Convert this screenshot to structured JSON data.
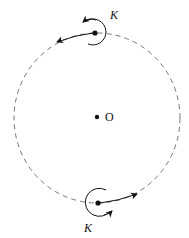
{
  "diagram": {
    "center": {
      "label": "O"
    },
    "top_body": {
      "spin_label": "K"
    },
    "bottom_body": {
      "spin_label": "K"
    },
    "colors": {
      "orbit": "#777777",
      "ink": "#111111"
    }
  }
}
